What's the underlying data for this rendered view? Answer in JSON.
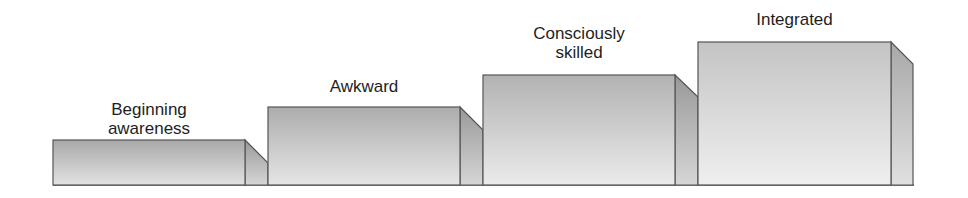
{
  "diagram": {
    "type": "staircase",
    "steps": [
      {
        "label": "Beginning\nawareness",
        "order": 1
      },
      {
        "label": "Awkward",
        "order": 2
      },
      {
        "label": "Consciously\nskilled",
        "order": 3
      },
      {
        "label": "Integrated",
        "order": 4
      }
    ],
    "colors": {
      "front_top": "#a8a8a8",
      "front_bottom": "#e8e8e8",
      "side_top": "#9a9a9a",
      "side_bottom": "#d4d4d4",
      "outline": "#555555",
      "text": "#1e1e1e"
    }
  }
}
